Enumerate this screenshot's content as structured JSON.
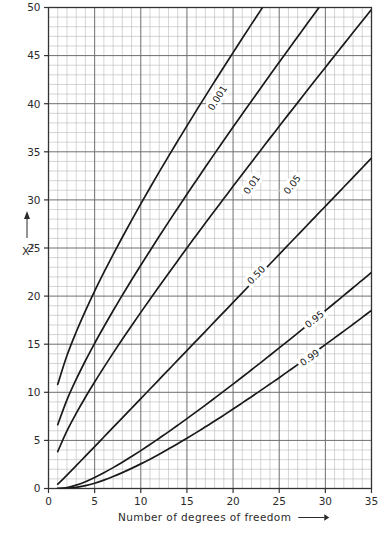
{
  "chart_data": {
    "type": "line",
    "title": "",
    "xlabel": "Number of degrees of freedom",
    "ylabel": "X2",
    "ylabel_base": "X",
    "ylabel_exponent": "2",
    "xlim": [
      0,
      35
    ],
    "ylim": [
      0,
      50
    ],
    "xticks": [
      0,
      5,
      10,
      15,
      20,
      25,
      30,
      35
    ],
    "xtick_labels": [
      "0",
      "5",
      "10",
      "15",
      "20",
      "25",
      "30",
      "35"
    ],
    "yticks": [
      0,
      5,
      10,
      15,
      20,
      25,
      30,
      35,
      40,
      45,
      50
    ],
    "ytick_labels": [
      "0",
      "5",
      "10",
      "15",
      "20",
      "25",
      "30",
      "35",
      "40",
      "45",
      "50"
    ],
    "grid": true,
    "grid_minor_step_x": 1,
    "grid_minor_step_y": 1,
    "grid_major_step_x": 5,
    "grid_major_step_y": 5,
    "legend_position": "inline-on-curves",
    "x": [
      1,
      2,
      3,
      4,
      5,
      6,
      7,
      8,
      9,
      10,
      11,
      12,
      13,
      14,
      15,
      16,
      17,
      18,
      19,
      20,
      21,
      22,
      23,
      24,
      25,
      26,
      27,
      28,
      29,
      30,
      31,
      32,
      33,
      34,
      35
    ],
    "series": [
      {
        "name": "0.001",
        "label": "0.001",
        "label_x": 18.3,
        "label_y": 40.6,
        "values": [
          10.83,
          13.82,
          16.27,
          18.47,
          20.52,
          22.46,
          24.32,
          26.12,
          27.88,
          29.59,
          31.26,
          32.91,
          34.53,
          36.12,
          37.7,
          39.25,
          40.79,
          42.31,
          43.82,
          45.31,
          46.8,
          48.27,
          49.73,
          51.18,
          52.62,
          54.05,
          55.48,
          56.89,
          58.3,
          59.7,
          61.1,
          62.49,
          63.87,
          65.25,
          66.62
        ]
      },
      {
        "name": "0.01",
        "label": "0.01",
        "label_x": 22.0,
        "label_y": 31.6,
        "values": [
          6.63,
          9.21,
          11.34,
          13.28,
          15.09,
          16.81,
          18.48,
          20.09,
          21.67,
          23.21,
          24.72,
          26.22,
          27.69,
          29.14,
          30.58,
          32.0,
          33.41,
          34.81,
          36.19,
          37.57,
          38.93,
          40.29,
          41.64,
          42.98,
          44.31,
          45.64,
          46.96,
          48.28,
          49.59,
          50.89,
          52.19,
          53.49,
          54.78,
          56.06,
          57.34
        ]
      },
      {
        "name": "0.05",
        "label": "0.05",
        "label_x": 26.4,
        "label_y": 31.6,
        "values": [
          3.84,
          5.99,
          7.81,
          9.49,
          11.07,
          12.59,
          14.07,
          15.51,
          16.92,
          18.31,
          19.68,
          21.03,
          22.36,
          23.68,
          25.0,
          26.3,
          27.59,
          28.87,
          30.14,
          31.41,
          32.67,
          33.92,
          35.17,
          36.42,
          37.65,
          38.89,
          40.11,
          41.34,
          42.56,
          43.77,
          44.99,
          46.19,
          47.4,
          48.6,
          49.8
        ]
      },
      {
        "name": "0.50",
        "label": "0.50",
        "label_x": 22.5,
        "label_y": 22.2,
        "values": [
          0.45,
          1.39,
          2.37,
          3.36,
          4.35,
          5.35,
          6.35,
          7.34,
          8.34,
          9.34,
          10.34,
          11.34,
          12.34,
          13.34,
          14.34,
          15.34,
          16.34,
          17.34,
          18.34,
          19.34,
          20.34,
          21.34,
          22.34,
          23.34,
          24.34,
          25.34,
          26.34,
          27.34,
          28.34,
          29.34,
          30.34,
          31.34,
          32.34,
          33.34,
          34.34
        ]
      },
      {
        "name": "0.95",
        "label": "0.95",
        "label_x": 28.8,
        "label_y": 17.6,
        "values": [
          0.004,
          0.1,
          0.35,
          0.71,
          1.15,
          1.64,
          2.17,
          2.73,
          3.33,
          3.94,
          4.57,
          5.23,
          5.89,
          6.57,
          7.26,
          7.96,
          8.67,
          9.39,
          10.12,
          10.85,
          11.59,
          12.34,
          13.09,
          13.85,
          14.61,
          15.38,
          16.15,
          16.93,
          17.71,
          18.49,
          19.28,
          20.07,
          20.87,
          21.66,
          22.47
        ]
      },
      {
        "name": "0.99",
        "label": "0.99",
        "label_x": 28.3,
        "label_y": 13.6,
        "values": [
          0.0002,
          0.02,
          0.11,
          0.3,
          0.55,
          0.87,
          1.24,
          1.65,
          2.09,
          2.56,
          3.05,
          3.57,
          4.11,
          4.66,
          5.23,
          5.81,
          6.41,
          7.01,
          7.63,
          8.26,
          8.9,
          9.54,
          10.2,
          10.86,
          11.52,
          12.2,
          12.88,
          13.56,
          14.26,
          14.95,
          15.66,
          16.36,
          17.07,
          17.79,
          18.51
        ]
      }
    ]
  },
  "colors": {
    "curve": "#1a1a1a",
    "grid_minor": "#b9b9b9",
    "grid_major": "#6e6e6e",
    "axis": "#333333",
    "text": "#2b2b2b",
    "background": "#ffffff"
  },
  "axis_arrow": {
    "x_arrow": "arrow-right",
    "y_arrow": "arrow-up"
  }
}
